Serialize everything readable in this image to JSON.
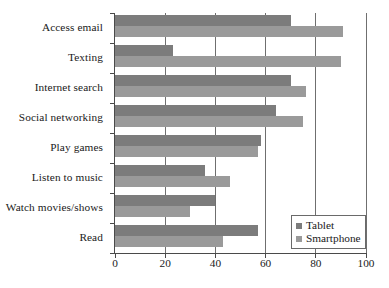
{
  "chart_data": {
    "type": "bar",
    "orientation": "horizontal",
    "title": "",
    "subtitle": "",
    "xlabel": "",
    "ylabel": "",
    "xlim": [
      0,
      100
    ],
    "xticks": [
      0,
      20,
      40,
      60,
      80,
      100
    ],
    "xtick_labels": [
      "0",
      "20",
      "40",
      "60",
      "80",
      "100"
    ],
    "grid": true,
    "grid_axis": "x",
    "legend_position": "bottom-right",
    "categories": [
      "Access email",
      "Texting",
      "Internet search",
      "Social networking",
      "Play games",
      "Listen to music",
      "Watch movies/shows",
      "Read"
    ],
    "series": [
      {
        "name": "Tablet",
        "color": "#7c7c7c",
        "values": [
          70,
          23,
          70,
          64,
          58,
          36,
          40,
          57
        ]
      },
      {
        "name": "Smartphone",
        "color": "#9a9a9a",
        "values": [
          91,
          90,
          76,
          75,
          57,
          46,
          30,
          43
        ]
      }
    ]
  },
  "legend": {
    "entries": [
      {
        "label": "Tablet",
        "color": "#7c7c7c"
      },
      {
        "label": "Smartphone",
        "color": "#9a9a9a"
      }
    ]
  },
  "colors": {
    "tablet": "#7c7c7c",
    "smartphone": "#9a9a9a",
    "axis": "#4a4a4a",
    "gridline": "#6f6f6f",
    "background": "#ffffff",
    "text": "#1a1a1a"
  }
}
